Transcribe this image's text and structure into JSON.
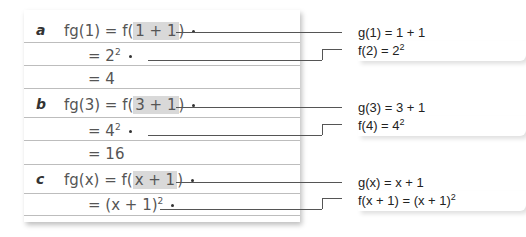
{
  "parts": [
    {
      "label": "a",
      "lines": [
        {
          "prefix": "fg(1) = f(",
          "highlight": "1 + 1",
          "suffix": ")"
        },
        {
          "text": "= 2",
          "sup": "2"
        },
        {
          "text": "= 4"
        }
      ],
      "notes": [
        {
          "text": "g(1) = 1 + 1"
        },
        {
          "text": "f(2) = 2",
          "sup": "2"
        }
      ]
    },
    {
      "label": "b",
      "lines": [
        {
          "prefix": "fg(3) = f(",
          "highlight": "3 + 1",
          "suffix": ")"
        },
        {
          "text": "= 4",
          "sup": "2"
        },
        {
          "text": "= 16"
        }
      ],
      "notes": [
        {
          "text": "g(3) = 3 + 1"
        },
        {
          "text": "f(4) = 4",
          "sup": "2"
        }
      ]
    },
    {
      "label": "c",
      "lines": [
        {
          "prefix": "fg(x) = f(",
          "highlight": "x + 1",
          "suffix": ")"
        },
        {
          "text": "= (x + 1)",
          "sup": "2"
        }
      ],
      "notes": [
        {
          "text": "g(x) = x + 1"
        },
        {
          "text": "f(x + 1) = (x + 1)",
          "sup": "2"
        }
      ]
    }
  ]
}
